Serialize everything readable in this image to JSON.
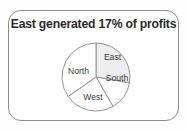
{
  "slide": {
    "background_color": "#fefefe",
    "frame": {
      "border_color": "#8d8d8d",
      "fill_color": "#ffffff"
    }
  },
  "title": {
    "text": "East generated 17% of profits"
  },
  "chart_data": {
    "type": "pie",
    "title": "East generated 17% of profits",
    "xlabel": "",
    "ylabel": "",
    "legend_position": "none",
    "labels_inside_slices": true,
    "categories": [
      "East",
      "South",
      "West",
      "North"
    ],
    "values": [
      28,
      14,
      24,
      34
    ],
    "value_unit": "percent",
    "start_angle_deg": 0,
    "direction": "clockwise",
    "slices": [
      {
        "label": "East",
        "value": 28,
        "start_angle_deg": 0,
        "end_angle_deg": 100,
        "fill": "#eeeeee",
        "stroke": "#8a8a8a",
        "highlighted": true,
        "label_x": 52.5,
        "label_y": 16.5
      },
      {
        "label": "South",
        "value": 14,
        "start_angle_deg": 100,
        "end_angle_deg": 150,
        "fill": "#ffffff",
        "stroke": "#8a8a8a",
        "highlighted": false,
        "label_x": 57.0,
        "label_y": 38.0
      },
      {
        "label": "West",
        "value": 24,
        "start_angle_deg": 150,
        "end_angle_deg": 235,
        "fill": "#ffffff",
        "stroke": "#8a8a8a",
        "highlighted": false,
        "label_x": 33.0,
        "label_y": 57.0
      },
      {
        "label": "North",
        "value": 34,
        "start_angle_deg": 235,
        "end_angle_deg": 360,
        "fill": "#ffffff",
        "stroke": "#8a8a8a",
        "highlighted": false,
        "label_x": 18.5,
        "label_y": 31.0
      }
    ],
    "geometry": {
      "center_x": 36,
      "center_y": 36,
      "radius": 34
    }
  }
}
